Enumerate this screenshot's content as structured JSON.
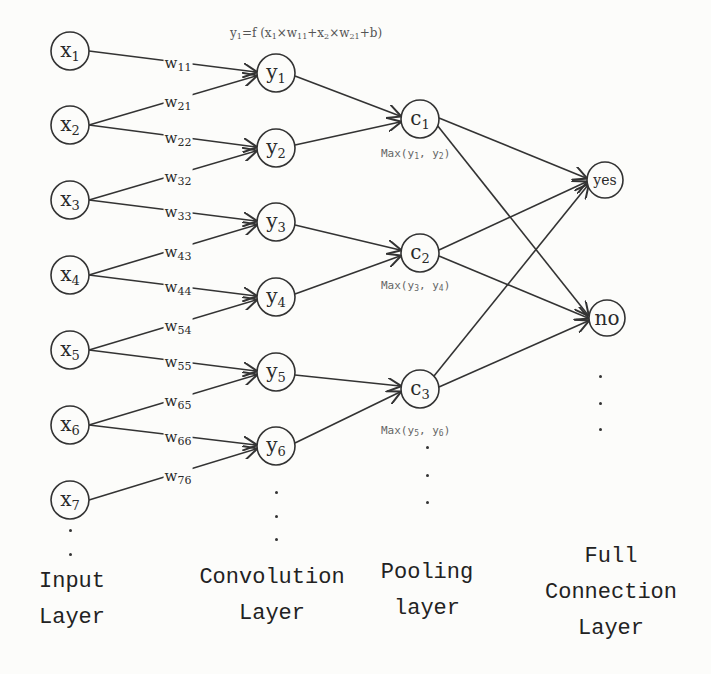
{
  "diagram": {
    "formula": {
      "prefix": "y",
      "prefix_sub": "1",
      "text_before": "=f (x",
      "x1_sub": "1",
      "times1": "×w",
      "w11_sub": "11",
      "plus1": "+x",
      "x2_sub": "2",
      "times2": "×w",
      "w21_sub": "21",
      "tail": "+b)"
    },
    "input_nodes": [
      {
        "label": "x",
        "sub": "1"
      },
      {
        "label": "x",
        "sub": "2"
      },
      {
        "label": "x",
        "sub": "3"
      },
      {
        "label": "x",
        "sub": "4"
      },
      {
        "label": "x",
        "sub": "5"
      },
      {
        "label": "x",
        "sub": "6"
      },
      {
        "label": "x",
        "sub": "7"
      }
    ],
    "conv_nodes": [
      {
        "label": "y",
        "sub": "1"
      },
      {
        "label": "y",
        "sub": "2"
      },
      {
        "label": "y",
        "sub": "3"
      },
      {
        "label": "y",
        "sub": "4"
      },
      {
        "label": "y",
        "sub": "5"
      },
      {
        "label": "y",
        "sub": "6"
      }
    ],
    "pool_nodes": [
      {
        "label": "c",
        "sub": "1",
        "max_prefix": "Max(y",
        "a": "1",
        "mid": ", y",
        "b": "2",
        "close": ")"
      },
      {
        "label": "c",
        "sub": "2",
        "max_prefix": "Max(y",
        "a": "3",
        "mid": ", y",
        "b": "4",
        "close": ")"
      },
      {
        "label": "c",
        "sub": "3",
        "max_prefix": "Max(y",
        "a": "5",
        "mid": ", y",
        "b": "6",
        "close": ")"
      }
    ],
    "output_nodes": [
      {
        "label": "yes"
      },
      {
        "label": "no"
      }
    ],
    "weights": [
      {
        "label": "w",
        "sub": "11"
      },
      {
        "label": "w",
        "sub": "21"
      },
      {
        "label": "w",
        "sub": "22"
      },
      {
        "label": "w",
        "sub": "32"
      },
      {
        "label": "w",
        "sub": "33"
      },
      {
        "label": "w",
        "sub": "43"
      },
      {
        "label": "w",
        "sub": "44"
      },
      {
        "label": "w",
        "sub": "54"
      },
      {
        "label": "w",
        "sub": "55"
      },
      {
        "label": "w",
        "sub": "65"
      },
      {
        "label": "w",
        "sub": "66"
      },
      {
        "label": "w",
        "sub": "76"
      }
    ],
    "layers": {
      "input": {
        "line1": "Input",
        "line2": "Layer"
      },
      "conv": {
        "line1": "Convolution",
        "line2": "Layer"
      },
      "pool": {
        "line1": "Pooling",
        "line2": "layer"
      },
      "full": {
        "line1": "Full",
        "line2": "Connection",
        "line3": "Layer"
      }
    },
    "colors": {
      "stroke": "#333333",
      "background": "#fcfcfa",
      "annotation": "#666666"
    }
  }
}
